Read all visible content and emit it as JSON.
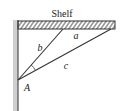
{
  "diagram": {
    "title": "Shelf",
    "labels": {
      "shelf_segment": "a",
      "brace_short": "b",
      "brace_long": "c",
      "vertex": "A"
    },
    "colors": {
      "line": "#333333",
      "wall_fill": "#cfcfcf",
      "hatch": "#333333"
    }
  }
}
